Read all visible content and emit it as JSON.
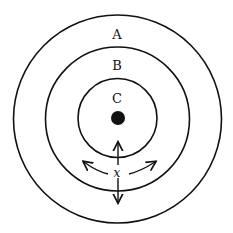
{
  "diagram": {
    "type": "concentric-circles",
    "regions": [
      {
        "id": "A",
        "label": "A",
        "radius": 104
      },
      {
        "id": "B",
        "label": "B",
        "radius": 72
      },
      {
        "id": "C",
        "label": "C",
        "radius": 40
      }
    ],
    "center_point": {
      "label": "",
      "radius": 7
    },
    "variable_label": "x",
    "arrows": [
      "up",
      "down",
      "curve-left",
      "curve-right"
    ],
    "colors": {
      "stroke": "#111111",
      "background": "#ffffff"
    }
  }
}
